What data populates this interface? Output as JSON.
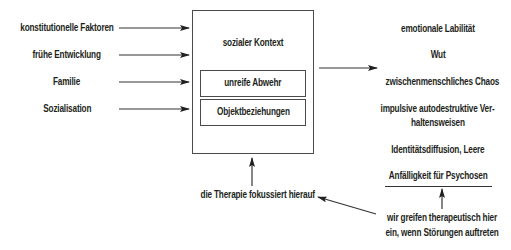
{
  "diagram": {
    "inputs": [
      {
        "label": "konstitutionelle Faktoren"
      },
      {
        "label": "frühe Entwicklung"
      },
      {
        "label": "Familie"
      },
      {
        "label": "Sozialisation"
      }
    ],
    "central_box": {
      "title": "sozialer Kontext",
      "inner_boxes": [
        {
          "label": "unreife Abwehr"
        },
        {
          "label": "Objektbeziehungen"
        }
      ]
    },
    "outputs": [
      {
        "label": "emotionale Labilität"
      },
      {
        "label": "Wut"
      },
      {
        "label": "zwischenmenschliches Chaos"
      },
      {
        "label_line1": "impulsive autodestruktive Ver-",
        "label_line2": "haltensweisen"
      },
      {
        "label": "Identitätsdiffusion, Leere"
      },
      {
        "label": "Anfälligkeit für Psychosen"
      }
    ],
    "therapy_focus_note": "die Therapie fokussiert hierauf",
    "intervention_note": {
      "line1": "wir greifen therapeutisch hier",
      "line2": "ein, wenn Störungen auftreten"
    },
    "colors": {
      "text": "#231f20",
      "lines": "#333333",
      "background": "#ffffff"
    }
  }
}
